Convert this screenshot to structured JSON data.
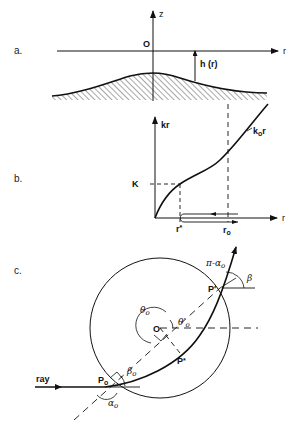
{
  "panels": {
    "a": {
      "label": "a.",
      "axis_z": "z",
      "axis_r": "r",
      "origin": "O",
      "depth_label": "h (r)"
    },
    "b": {
      "label": "b.",
      "axis_y": "kr",
      "axis_x": "r",
      "curve_label": "k₀r",
      "curve_label_k": "k",
      "curve_label_sub": "o",
      "curve_label_r": "r",
      "level_label": "K",
      "tick_r_star": "r∗",
      "tick_r_star_main": "r",
      "tick_r_star_sub": "*",
      "tick_r0_main": "r",
      "tick_r0_sub": "o"
    },
    "c": {
      "label": "c.",
      "center": "O",
      "ray_label": "ray",
      "point_P0_main": "P",
      "point_P0_sub": "o",
      "point_Pprime": "P′",
      "point_Pstar": "P",
      "point_Pstar_sub": "*",
      "theta0": "θ",
      "theta0_sub": "o",
      "theta0_prime": "θ′",
      "theta0_prime_sub": "o",
      "beta0": "β",
      "beta0_sub": "o",
      "alpha0": "α",
      "alpha0_sub": "o",
      "beta": "β",
      "pi_minus_alpha": "π-α",
      "pi_minus_alpha_sub": "o"
    }
  }
}
